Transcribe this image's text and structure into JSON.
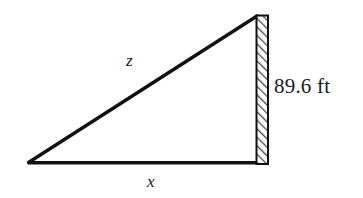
{
  "figure": {
    "type": "right-triangle-diagram",
    "stroke_color": "#111111",
    "background_color": "#ffffff",
    "hatch_color": "#555555"
  },
  "labels": {
    "hypotenuse": "z",
    "base": "x",
    "height": "89.6 ft"
  },
  "geometry": {
    "left_vertex": [
      28,
      163
    ],
    "apex": [
      256,
      16
    ],
    "right_angle_vertex": [
      256,
      163
    ],
    "wall_left_x": 256,
    "wall_right_x": 268,
    "wall_top_y": 15,
    "wall_bottom_y": 164
  }
}
